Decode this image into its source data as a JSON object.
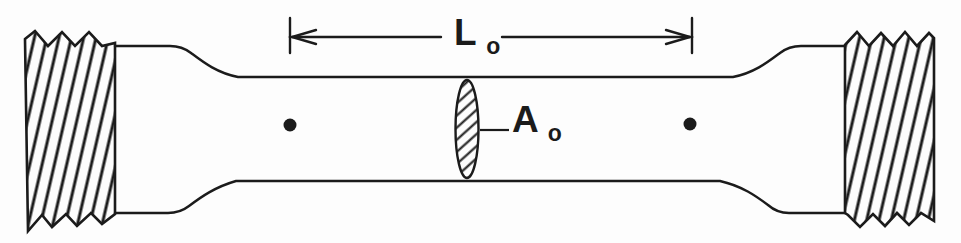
{
  "diagram": {
    "labels": {
      "gauge_length": {
        "main": "L",
        "sub": "o"
      },
      "cross_section_area": {
        "main": "A",
        "sub": "o"
      }
    },
    "colors": {
      "line": "#1b1b1b",
      "background": "#fdfdfd",
      "specimen_fill": "#fdfdfd"
    }
  }
}
